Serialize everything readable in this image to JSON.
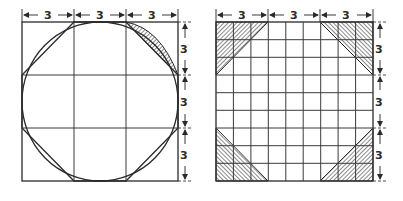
{
  "figure": {
    "left_panel": {
      "description": "Square divided into 3x3 grid with inscribed circle and octagon approximation",
      "grid_divisions": 3,
      "top_dimensions": [
        "3",
        "3",
        "3"
      ],
      "side_dimensions": [
        "3",
        "3",
        "3"
      ]
    },
    "right_panel": {
      "description": "Square divided into 9x9 grid with shaded corner triangles",
      "grid_divisions": 9,
      "top_dimensions": [
        "3",
        "3",
        "3"
      ],
      "side_dimensions": [
        "3",
        "3",
        "3"
      ]
    },
    "colors": {
      "line": "#2a2a2a",
      "background": "#ffffff"
    }
  }
}
